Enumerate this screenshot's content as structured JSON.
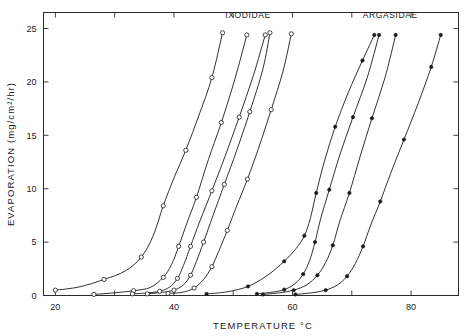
{
  "chart_data": {
    "type": "line",
    "title": "",
    "xlabel": "TEMPERATURE  °C",
    "ylabel": "EVAPORATION  (mg/cm²/hr)",
    "xlim": [
      18,
      88
    ],
    "ylim": [
      0,
      26.5
    ],
    "grid": false,
    "legend_position": "inside-top",
    "x_ticks": [
      20,
      30,
      40,
      50,
      60,
      70,
      80
    ],
    "x_tick_labels": [
      "20",
      "",
      "40",
      "",
      "60",
      "",
      "80"
    ],
    "y_ticks": [
      0,
      5,
      10,
      15,
      20,
      25
    ],
    "y_tick_labels": [
      "0",
      "5",
      "10",
      "15",
      "20",
      "25"
    ],
    "annotations": [
      {
        "text": "IXODIDAE",
        "x": 52.5,
        "y": 26.0
      },
      {
        "text": "ARGASIDAE",
        "x": 76.5,
        "y": 26.0
      }
    ],
    "groups": [
      {
        "name": "IXODIDAE",
        "marker": "open-circle"
      },
      {
        "name": "ARGASIDAE",
        "marker": "filled-circle"
      }
    ],
    "series": [
      {
        "name": "Ixodidae curve 1",
        "group": "IXODIDAE",
        "marker": "open-circle",
        "x": [
          20.0,
          24.0,
          28.2,
          31.8,
          34.5,
          36.5,
          38.2,
          40.0,
          42.0,
          44.3,
          46.4,
          48.2
        ],
        "y": [
          0.5,
          0.8,
          1.5,
          2.3,
          3.6,
          5.6,
          8.4,
          11.0,
          13.6,
          17.0,
          20.4,
          24.6
        ]
      },
      {
        "name": "Ixodidae curve 2",
        "group": "IXODIDAE",
        "marker": "open-circle",
        "x": [
          26.5,
          30.0,
          33.2,
          36.0,
          38.2,
          39.6,
          40.8,
          42.2,
          43.8,
          45.8,
          48.0,
          50.3,
          52.3
        ],
        "y": [
          0.1,
          0.25,
          0.45,
          0.75,
          1.7,
          2.9,
          4.6,
          6.8,
          9.2,
          12.7,
          16.2,
          20.3,
          24.4
        ]
      },
      {
        "name": "Ixodidae curve 3",
        "group": "IXODIDAE",
        "marker": "open-circle",
        "x": [
          33.0,
          35.6,
          37.6,
          39.3,
          40.6,
          41.6,
          42.8,
          44.4,
          46.4,
          48.6,
          51.0,
          53.4,
          55.4
        ],
        "y": [
          0.15,
          0.25,
          0.4,
          0.8,
          1.6,
          2.8,
          4.6,
          7.0,
          9.8,
          13.0,
          16.7,
          20.6,
          24.4
        ]
      },
      {
        "name": "Ixodidae curve 4",
        "group": "IXODIDAE",
        "marker": "open-circle",
        "x": [
          35.5,
          38.0,
          40.0,
          41.6,
          42.8,
          43.8,
          45.0,
          46.6,
          48.5,
          50.6,
          52.8,
          55.0,
          56.2
        ],
        "y": [
          0.15,
          0.3,
          0.5,
          1.0,
          1.9,
          3.2,
          5.0,
          7.5,
          10.4,
          13.6,
          17.2,
          21.2,
          24.6
        ]
      },
      {
        "name": "Ixodidae curve 5",
        "group": "IXODIDAE",
        "marker": "open-circle",
        "x": [
          39.0,
          41.4,
          43.4,
          45.0,
          46.4,
          47.6,
          49.0,
          50.6,
          52.4,
          54.4,
          56.4,
          58.4,
          59.8
        ],
        "y": [
          0.2,
          0.3,
          0.7,
          1.5,
          2.7,
          4.2,
          6.1,
          8.4,
          10.9,
          14.0,
          17.4,
          21.0,
          24.5
        ]
      },
      {
        "name": "Argasidae curve 1",
        "group": "ARGASIDAE",
        "marker": "filled-circle",
        "x": [
          45.5,
          49.0,
          52.5,
          55.8,
          58.6,
          60.6,
          62.0,
          63.0,
          64.0,
          65.4,
          67.2,
          69.4,
          71.8,
          73.8
        ],
        "y": [
          0.15,
          0.35,
          0.85,
          1.9,
          3.2,
          4.4,
          5.6,
          7.2,
          9.6,
          12.6,
          15.8,
          19.0,
          22.0,
          24.4
        ]
      },
      {
        "name": "Argasidae curve 2",
        "group": "ARGASIDAE",
        "marker": "filled-circle",
        "x": [
          54.0,
          56.4,
          58.6,
          60.4,
          61.8,
          62.9,
          63.8,
          64.8,
          66.2,
          68.0,
          70.2,
          72.6,
          74.6
        ],
        "y": [
          0.15,
          0.3,
          0.55,
          1.1,
          2.0,
          3.3,
          5.0,
          7.3,
          9.9,
          13.2,
          16.7,
          20.4,
          24.4
        ]
      },
      {
        "name": "Argasidae curve 3",
        "group": "ARGASIDAE",
        "marker": "filled-circle",
        "x": [
          55.0,
          57.8,
          60.2,
          62.4,
          64.2,
          65.6,
          66.8,
          68.0,
          69.6,
          71.4,
          73.4,
          75.6,
          77.4
        ],
        "y": [
          0.1,
          0.25,
          0.5,
          1.0,
          1.9,
          3.1,
          4.7,
          7.0,
          9.6,
          13.0,
          16.6,
          20.4,
          24.4
        ]
      },
      {
        "name": "Argasidae curve 4",
        "group": "ARGASIDAE",
        "marker": "filled-circle",
        "x": [
          60.5,
          63.2,
          65.6,
          67.6,
          69.2,
          70.6,
          71.9,
          73.2,
          74.8,
          76.6,
          78.8,
          81.2,
          83.4,
          85.0
        ],
        "y": [
          0.1,
          0.25,
          0.5,
          1.0,
          1.8,
          3.0,
          4.6,
          6.6,
          8.8,
          11.5,
          14.6,
          18.0,
          21.4,
          24.4
        ]
      }
    ]
  }
}
